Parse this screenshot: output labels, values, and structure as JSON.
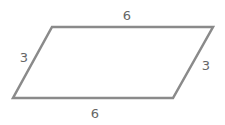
{
  "diagram": {
    "shape": "parallelogram",
    "stroke_color": "#8a8a8a",
    "label_color": "#666666",
    "vertices": [
      [
        52,
        27
      ],
      [
        213,
        27
      ],
      [
        173,
        98
      ],
      [
        13,
        98
      ]
    ],
    "labels": {
      "top": "6",
      "left": "3",
      "right": "3",
      "bottom": "6"
    }
  }
}
